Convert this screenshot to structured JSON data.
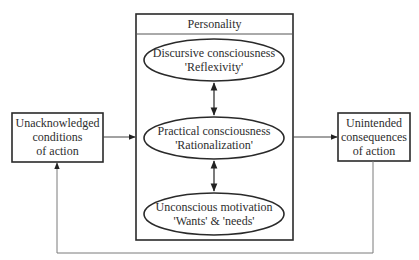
{
  "diagram": {
    "personality_box": {
      "title": "Personality"
    },
    "left_box": {
      "lines": [
        "Unacknowledged",
        "conditions",
        "of action"
      ]
    },
    "right_box": {
      "lines": [
        "Unintended",
        "consequences",
        "of action"
      ]
    },
    "ellipses": [
      {
        "id": "discursive",
        "line1": "Discursive consciousness",
        "line2": "'Reflexivity'"
      },
      {
        "id": "practical",
        "line1": "Practical consciousness",
        "line2": "'Rationalization'"
      },
      {
        "id": "unconscious",
        "line1": "Unconscious motivation",
        "line2": "'Wants' & 'needs'"
      }
    ],
    "edges": [
      {
        "from": "left_box",
        "to": "personality_box",
        "type": "arrow"
      },
      {
        "from": "personality_box",
        "to": "right_box",
        "type": "arrow"
      },
      {
        "from": "discursive",
        "to": "practical",
        "type": "bidirectional"
      },
      {
        "from": "practical",
        "to": "unconscious",
        "type": "bidirectional"
      },
      {
        "from": "right_box",
        "to": "left_box",
        "type": "feedback-loop-arrow"
      }
    ],
    "colors": {
      "line": "#2a2a2a",
      "feedback_line": "#7a7a7a",
      "background": "#ffffff"
    }
  }
}
